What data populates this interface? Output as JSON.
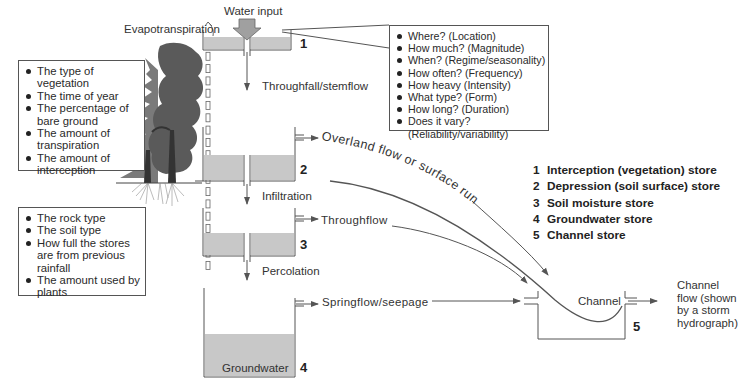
{
  "labels": {
    "evapotranspiration": "Evapotranspiration",
    "water_input": "Water input",
    "throughfall": "Throughfall/stemflow",
    "infiltration": "Infiltration",
    "percolation": "Percolation",
    "overland_flow": "Overland flow or surface runoff",
    "throughflow": "Throughflow",
    "springflow": "Springflow/seepage",
    "channel": "Channel",
    "groundwater": "Groundwater",
    "channel_flow": [
      "Channel",
      "flow (shown",
      "by a storm",
      "hydrograph)"
    ]
  },
  "store_numbers": [
    "1",
    "2",
    "3",
    "4",
    "5"
  ],
  "water_input_box": [
    "Where? (Location)",
    "How much? (Magnitude)",
    "When? (Regime/seasonality)",
    "How often? (Frequency)",
    "How heavy (Intensity)",
    "What type? (Form)",
    "How long? (Duration)",
    "Does it vary? (Reliability/variability)"
  ],
  "vegetation_box": [
    "The type of vegetation",
    "The time of year",
    "The percentage of bare ground",
    "The amount of transpiration",
    "The amount of interception"
  ],
  "soil_box": [
    "The rock type",
    "The soil type",
    "How full the stores are from previous rainfall",
    "The amount used by plants"
  ],
  "legend": [
    {
      "num": "1",
      "label": "Interception (vegetation) store"
    },
    {
      "num": "2",
      "label": "Depression (soil surface) store"
    },
    {
      "num": "3",
      "label": "Soil moisture store"
    },
    {
      "num": "4",
      "label": "Groundwater store"
    },
    {
      "num": "5",
      "label": "Channel store"
    }
  ],
  "colors": {
    "water_fill": "#c8c8c8",
    "line": "#555555",
    "tree_dark": "#3a3a3a",
    "tree_mid": "#6e6e6e"
  }
}
